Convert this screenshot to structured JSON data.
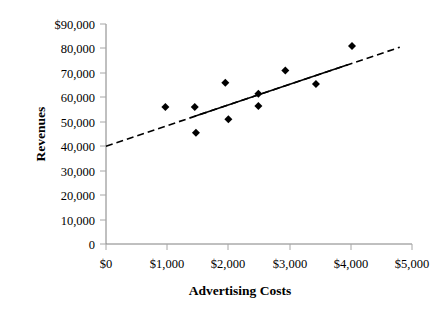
{
  "chart_data": {
    "type": "scatter",
    "title": "",
    "xlabel": "Advertising Costs",
    "ylabel": "Revenues",
    "xlim": [
      0,
      5000
    ],
    "ylim": [
      0,
      90000
    ],
    "grid": false,
    "legend": null,
    "x_tick_labels": [
      "$0",
      "$1,000",
      "$2,000",
      "$3,000",
      "$4,000",
      "$5,000"
    ],
    "x_tick_values": [
      0,
      1000,
      2000,
      3000,
      4000,
      5000
    ],
    "y_tick_labels": [
      "0",
      "10,000",
      "20,000",
      "30,000",
      "40,000",
      "50,000",
      "60,000",
      "70,000",
      "80,000",
      "$90,000"
    ],
    "y_tick_values": [
      0,
      10000,
      20000,
      30000,
      40000,
      50000,
      60000,
      70000,
      80000,
      90000
    ],
    "points": [
      {
        "x": 970,
        "y": 56000
      },
      {
        "x": 1450,
        "y": 56000
      },
      {
        "x": 1470,
        "y": 45500
      },
      {
        "x": 1950,
        "y": 66000
      },
      {
        "x": 2000,
        "y": 51000
      },
      {
        "x": 2490,
        "y": 61500
      },
      {
        "x": 2490,
        "y": 56500
      },
      {
        "x": 2930,
        "y": 71000
      },
      {
        "x": 3430,
        "y": 65500
      },
      {
        "x": 4020,
        "y": 81000
      }
    ],
    "trendline": {
      "style": "dashed-with-solid-center",
      "x_start": 0,
      "y_start": 40000,
      "x_end": 4800,
      "y_end": 80500,
      "solid_x_start": 1450,
      "solid_x_end": 3950
    },
    "marker": {
      "shape": "diamond",
      "color": "#000000",
      "size": 8
    }
  }
}
